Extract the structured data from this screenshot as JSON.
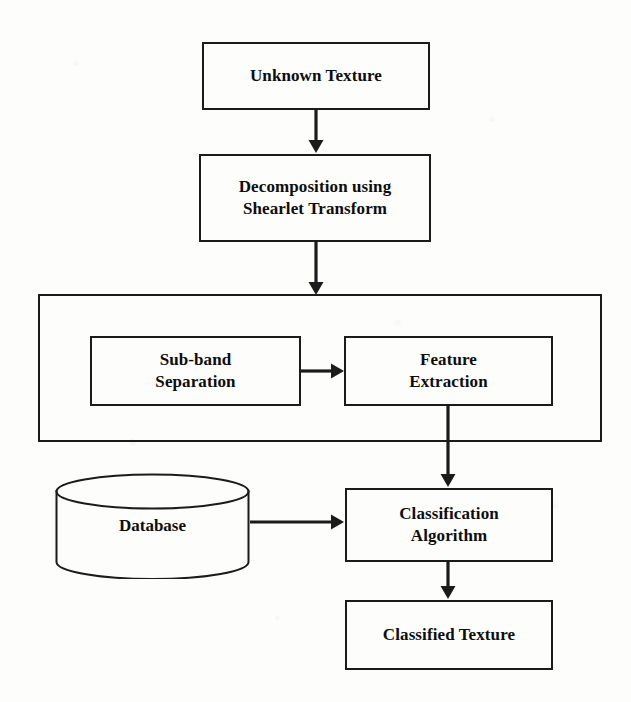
{
  "diagram": {
    "background_color": "#fdfdfc",
    "line_color": "#1b1b1b",
    "text_color": "#0d0d0d",
    "nodes": [
      {
        "id": "unknown-texture",
        "shape": "rectangle",
        "lines": [
          "Unknown Texture"
        ],
        "x": 202,
        "y": 42,
        "w": 228,
        "h": 68,
        "font_size": 17
      },
      {
        "id": "decomposition",
        "shape": "rectangle",
        "lines": [
          "Decomposition using",
          "Shearlet Transform"
        ],
        "x": 199,
        "y": 154,
        "w": 232,
        "h": 88,
        "font_size": 17
      },
      {
        "id": "feature-group",
        "shape": "container",
        "lines": [],
        "x": 38,
        "y": 294,
        "w": 564,
        "h": 148,
        "font_size": 0
      },
      {
        "id": "sub-band-separation",
        "shape": "rectangle",
        "lines": [
          "Sub-band",
          "Separation"
        ],
        "x": 90,
        "y": 336,
        "w": 211,
        "h": 70,
        "font_size": 17
      },
      {
        "id": "feature-extraction",
        "shape": "rectangle",
        "lines": [
          "Feature",
          "Extraction"
        ],
        "x": 344,
        "y": 336,
        "w": 209,
        "h": 70,
        "font_size": 17
      },
      {
        "id": "database",
        "shape": "cylinder",
        "lines": [
          "Database"
        ],
        "x": 55,
        "y": 473,
        "w": 195,
        "h": 106,
        "font_size": 17
      },
      {
        "id": "classification-algorithm",
        "shape": "rectangle",
        "lines": [
          "Classification",
          "Algorithm"
        ],
        "x": 345,
        "y": 488,
        "w": 208,
        "h": 74,
        "font_size": 17
      },
      {
        "id": "classified-texture",
        "shape": "rectangle",
        "lines": [
          "Classified Texture"
        ],
        "x": 345,
        "y": 600,
        "w": 208,
        "h": 70,
        "font_size": 17
      }
    ],
    "connectors": [
      {
        "id": "unknown-to-decomposition",
        "from": "unknown-texture",
        "to": "decomposition",
        "direction": "down",
        "x1": 316,
        "y1": 110,
        "x2": 316,
        "y2": 153
      },
      {
        "id": "decomposition-to-group",
        "from": "decomposition",
        "to": "feature-group",
        "direction": "down",
        "x1": 316,
        "y1": 242,
        "x2": 316,
        "y2": 295
      },
      {
        "id": "subband-to-feature",
        "from": "sub-band-separation",
        "to": "feature-extraction",
        "direction": "right",
        "x1": 301,
        "y1": 371,
        "x2": 344,
        "y2": 371
      },
      {
        "id": "feature-to-classification",
        "from": "feature-extraction",
        "to": "classification-algorithm",
        "direction": "down",
        "x1": 448,
        "y1": 406,
        "x2": 448,
        "y2": 487
      },
      {
        "id": "database-to-classification",
        "from": "database",
        "to": "classification-algorithm",
        "direction": "right",
        "x1": 250,
        "y1": 522,
        "x2": 344,
        "y2": 522
      },
      {
        "id": "classification-to-classified",
        "from": "classification-algorithm",
        "to": "classified-texture",
        "direction": "down",
        "x1": 448,
        "y1": 562,
        "x2": 448,
        "y2": 599
      }
    ]
  }
}
